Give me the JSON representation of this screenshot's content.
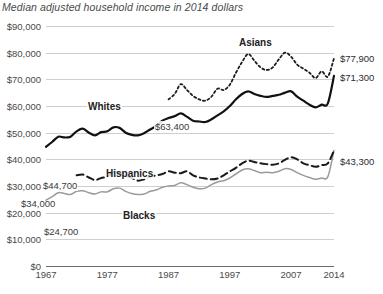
{
  "chart_data": {
    "type": "line",
    "title": "Median adjusted household income in 2014 dollars",
    "xlabel": "",
    "ylabel": "",
    "xlim": [
      1967,
      2014
    ],
    "ylim": [
      0,
      90000
    ],
    "grid": true,
    "legend_position": "inline-labels",
    "ytick_labels": [
      "$90,000",
      "$80,000",
      "$70,000",
      "$60,000",
      "$50,000",
      "$40,000",
      "$30,000",
      "$20,000",
      "$10,000",
      "$0"
    ],
    "ytick_values": [
      90000,
      80000,
      70000,
      60000,
      50000,
      40000,
      30000,
      20000,
      10000,
      0
    ],
    "xtick_labels": [
      "1967",
      "1977",
      "1987",
      "1997",
      "2007",
      "2014"
    ],
    "xtick_values": [
      1967,
      1977,
      1987,
      1997,
      2007,
      2014
    ],
    "series": [
      {
        "name": "Asians",
        "style": "dotted",
        "color": "#1d1d1d",
        "start_year": 1987,
        "end_value_label": "$77,900",
        "x": [
          1987,
          1988,
          1989,
          1990,
          1991,
          1992,
          1993,
          1994,
          1995,
          1996,
          1997,
          1998,
          1999,
          2000,
          2001,
          2002,
          2003,
          2004,
          2005,
          2006,
          2007,
          2008,
          2009,
          2010,
          2011,
          2012,
          2013,
          2014
        ],
        "values": [
          62500,
          64500,
          68200,
          66000,
          63800,
          62500,
          62000,
          63500,
          66500,
          66000,
          68000,
          72500,
          76500,
          79500,
          77000,
          74500,
          73500,
          74500,
          77500,
          80000,
          78500,
          75500,
          74000,
          72500,
          70500,
          73000,
          71000,
          77900
        ]
      },
      {
        "name": "Whites",
        "style": "solid-bold",
        "color": "#111111",
        "start_year": 1967,
        "start_value_label": "$44,700",
        "mid_value_label": "$63,400",
        "end_value_label": "$71,300",
        "x": [
          1967,
          1968,
          1969,
          1970,
          1971,
          1972,
          1973,
          1974,
          1975,
          1976,
          1977,
          1978,
          1979,
          1980,
          1981,
          1982,
          1983,
          1984,
          1985,
          1986,
          1987,
          1988,
          1989,
          1990,
          1991,
          1992,
          1993,
          1994,
          1995,
          1996,
          1997,
          1998,
          1999,
          2000,
          2001,
          2002,
          2003,
          2004,
          2005,
          2006,
          2007,
          2008,
          2009,
          2010,
          2011,
          2012,
          2013,
          2014
        ],
        "values": [
          44700,
          46500,
          48500,
          48200,
          48500,
          50500,
          51500,
          50000,
          49000,
          50200,
          50500,
          52000,
          51800,
          50000,
          49200,
          49000,
          49800,
          51200,
          52500,
          54500,
          55500,
          56200,
          57200,
          56000,
          54500,
          54200,
          54000,
          55000,
          56500,
          58000,
          60000,
          62500,
          64500,
          65500,
          64500,
          63800,
          63400,
          63800,
          64200,
          65000,
          65500,
          63500,
          62000,
          60500,
          59500,
          60500,
          61000,
          71300
        ]
      },
      {
        "name": "Hispanics",
        "style": "dashed",
        "color": "#1a1a1a",
        "start_year": 1972,
        "start_value_label": "$34,000",
        "end_value_label": "$43,300",
        "x": [
          1972,
          1973,
          1974,
          1975,
          1976,
          1977,
          1978,
          1979,
          1980,
          1981,
          1982,
          1983,
          1984,
          1985,
          1986,
          1987,
          1988,
          1989,
          1990,
          1991,
          1992,
          1993,
          1994,
          1995,
          1996,
          1997,
          1998,
          1999,
          2000,
          2001,
          2002,
          2003,
          2004,
          2005,
          2006,
          2007,
          2008,
          2009,
          2010,
          2011,
          2012,
          2013,
          2014
        ],
        "values": [
          34000,
          34300,
          33200,
          32200,
          33000,
          33500,
          35200,
          35000,
          33800,
          33000,
          32000,
          32500,
          33500,
          34000,
          34500,
          35500,
          35000,
          34800,
          35500,
          34000,
          33200,
          32800,
          32500,
          32800,
          34000,
          35500,
          36800,
          38500,
          39500,
          39000,
          38500,
          38200,
          38000,
          38500,
          39800,
          40800,
          40000,
          38500,
          37800,
          37200,
          37800,
          38500,
          43300
        ]
      },
      {
        "name": "Blacks",
        "style": "solid-gray",
        "color": "#9a9a9a",
        "start_year": 1967,
        "start_value_label": "$24,700",
        "end_value_label": "$43,300",
        "x": [
          1967,
          1968,
          1969,
          1970,
          1971,
          1972,
          1973,
          1974,
          1975,
          1976,
          1977,
          1978,
          1979,
          1980,
          1981,
          1982,
          1983,
          1984,
          1985,
          1986,
          1987,
          1988,
          1989,
          1990,
          1991,
          1992,
          1993,
          1994,
          1995,
          1996,
          1997,
          1998,
          1999,
          2000,
          2001,
          2002,
          2003,
          2004,
          2005,
          2006,
          2007,
          2008,
          2009,
          2010,
          2011,
          2012,
          2013,
          2014
        ],
        "values": [
          24700,
          26000,
          27500,
          27200,
          26800,
          28000,
          28200,
          27500,
          27000,
          27800,
          27800,
          29000,
          29200,
          28000,
          27200,
          26800,
          27000,
          28000,
          28500,
          29500,
          30000,
          30200,
          31200,
          30500,
          29500,
          29000,
          29200,
          30500,
          31500,
          32000,
          33000,
          34500,
          36000,
          36500,
          35800,
          35000,
          35200,
          35000,
          35500,
          36500,
          36200,
          35000,
          34000,
          33200,
          32500,
          33000,
          33500,
          43300
        ]
      }
    ],
    "annotations": [
      {
        "text": "$44,700",
        "series": "Whites",
        "position": "start"
      },
      {
        "text": "$63,400",
        "series": "Whites",
        "position": "middle"
      },
      {
        "text": "$34,000",
        "series": "Hispanics",
        "position": "start"
      },
      {
        "text": "$24,700",
        "series": "Blacks",
        "position": "start"
      },
      {
        "text": "$77,900",
        "series": "Asians",
        "position": "end"
      },
      {
        "text": "$71,300",
        "series": "Whites",
        "position": "end"
      },
      {
        "text": "$43,300",
        "series": "Hispanics",
        "position": "end"
      }
    ]
  }
}
